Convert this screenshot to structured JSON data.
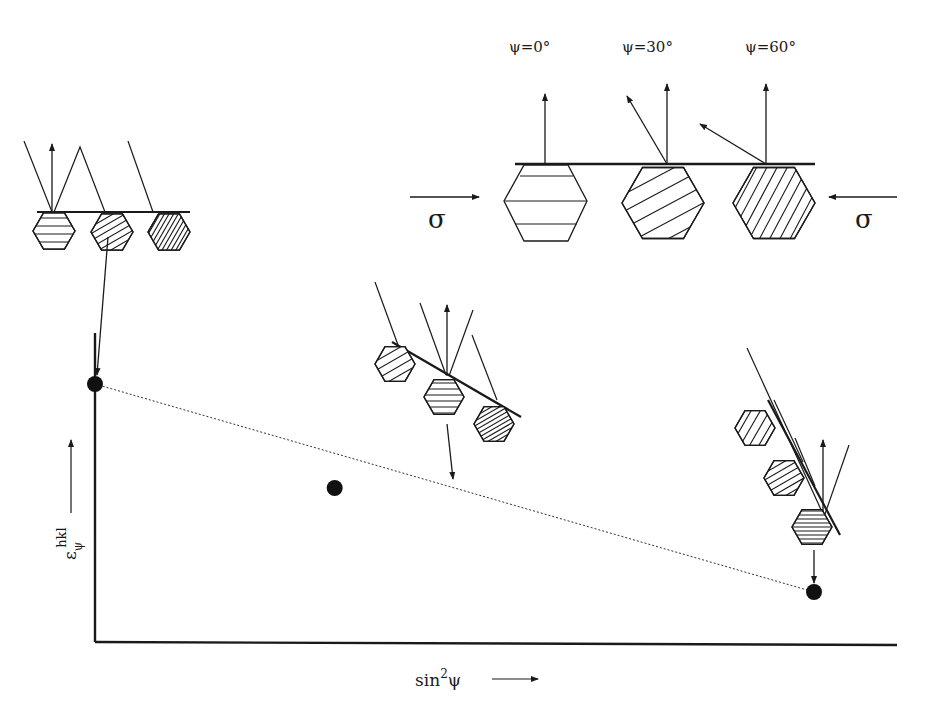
{
  "figure": {
    "top_panel": {
      "tilt_labels": [
        "ψ=0°",
        "ψ=30°",
        "ψ=60°"
      ],
      "stress_left": "σ",
      "stress_right": "σ"
    },
    "axes": {
      "y_label_main": "ε",
      "y_label_sub": "ψ",
      "y_label_sup": "hkl",
      "x_label_main": "sin",
      "x_label_sup": "2",
      "x_label_tail": "ψ"
    },
    "data_points": [
      {
        "name": "psi-0",
        "sin2psi": 0.0,
        "strain_relative": 1.0
      },
      {
        "name": "psi-30",
        "sin2psi": 0.25,
        "strain_relative": 0.5
      },
      {
        "name": "psi-60",
        "sin2psi": 0.75,
        "strain_relative": 0.0
      }
    ],
    "fit_line_style": "dotted",
    "colors": {
      "ink": "#1a1a1a",
      "background": "#ffffff"
    }
  }
}
